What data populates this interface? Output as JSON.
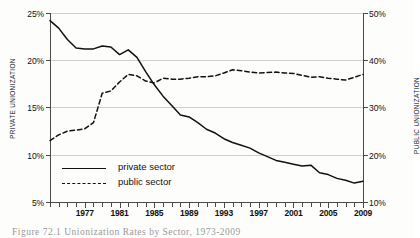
{
  "figure": {
    "caption": "Figure 72.1  Unionization Rates by Sector, 1973-2009"
  },
  "chart_data": {
    "type": "line",
    "title": "",
    "xlabel": "",
    "ylabel": "PRIVATE UNIONIZATION",
    "y2label": "PUBLIC UNIONIZATION",
    "xlim": [
      1973,
      2009
    ],
    "ylim": [
      5,
      25
    ],
    "y2lim": [
      10,
      50
    ],
    "grid": true,
    "legend_position": "inside-lower-left",
    "yticks": [
      "5%",
      "10%",
      "15%",
      "20%",
      "25%"
    ],
    "ytick_values": [
      5,
      10,
      15,
      20,
      25
    ],
    "y2ticks": [
      "10%",
      "20%",
      "30%",
      "40%",
      "50%"
    ],
    "y2tick_values": [
      10,
      20,
      30,
      40,
      50
    ],
    "xticks": [
      "1977",
      "1981",
      "1985",
      "1989",
      "1993",
      "1997",
      "2001",
      "2005",
      "2009"
    ],
    "xtick_values": [
      1977,
      1981,
      1985,
      1989,
      1993,
      1997,
      2001,
      2005,
      2009
    ],
    "x": [
      1973,
      1974,
      1975,
      1976,
      1977,
      1978,
      1979,
      1980,
      1981,
      1982,
      1983,
      1984,
      1985,
      1986,
      1987,
      1988,
      1989,
      1990,
      1991,
      1992,
      1993,
      1994,
      1995,
      1996,
      1997,
      1998,
      1999,
      2000,
      2001,
      2002,
      2003,
      2004,
      2005,
      2006,
      2007,
      2008,
      2009
    ],
    "series": [
      {
        "name": "private sector",
        "axis": "left",
        "style": "solid",
        "color": "#111111",
        "values": [
          24.2,
          23.4,
          22.2,
          21.3,
          21.2,
          21.2,
          21.5,
          21.4,
          20.6,
          21.1,
          20.3,
          18.8,
          17.4,
          16.2,
          15.2,
          14.2,
          14.0,
          13.4,
          12.7,
          12.3,
          11.7,
          11.3,
          11.0,
          10.7,
          10.2,
          9.8,
          9.4,
          9.2,
          9.0,
          8.8,
          8.9,
          8.1,
          7.9,
          7.5,
          7.3,
          7.0,
          7.2
        ]
      },
      {
        "name": "public sector",
        "axis": "right",
        "style": "dashed",
        "color": "#111111",
        "values": [
          23.0,
          24.2,
          25.0,
          25.2,
          25.5,
          26.8,
          33.0,
          33.5,
          35.4,
          37.0,
          36.7,
          35.6,
          35.2,
          36.2,
          36.0,
          36.0,
          36.2,
          36.5,
          36.5,
          36.7,
          37.3,
          38.0,
          37.8,
          37.5,
          37.3,
          37.4,
          37.5,
          37.3,
          37.2,
          36.8,
          36.4,
          36.5,
          36.2,
          36.0,
          35.8,
          36.4,
          37.0
        ]
      }
    ]
  }
}
